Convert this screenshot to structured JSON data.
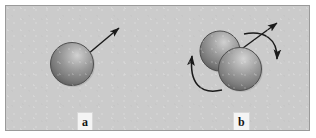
{
  "figure": {
    "panels": [
      {
        "id": "a",
        "label": "a",
        "description": "single sphere with straight translation arrow",
        "spheres": 1,
        "arrows": {
          "straight": 1,
          "curved": 0
        }
      },
      {
        "id": "b",
        "label": "b",
        "description": "two contacting spheres with straight translation arrow and two curved rotation arrows",
        "spheres": 2,
        "arrows": {
          "straight": 1,
          "curved": 2
        }
      }
    ],
    "colors": {
      "background": "#cbcbcb",
      "frame_border": "#9a9a9a",
      "sphere_light": "#c6c6c6",
      "sphere_mid": "#8e8e8e",
      "sphere_dark": "#5d5d5d",
      "sphere_edge": "#4a4a4a",
      "arrow": "#1a1a1a",
      "label_text": "#141414",
      "label_background": "#f4f4f4",
      "page": "#ffffff"
    }
  }
}
